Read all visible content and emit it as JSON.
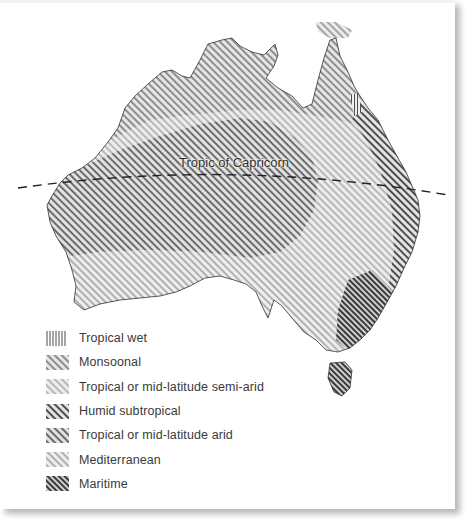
{
  "map": {
    "subject": "Australia climate zones",
    "tropic_line_label": "Tropic of Capricorn"
  },
  "legend": {
    "items": [
      {
        "label": "Tropical wet",
        "pattern": "vertical-lines",
        "color": "#555555"
      },
      {
        "label": "Monsoonal",
        "pattern": "diagonal-medium",
        "color": "#9a9a9a"
      },
      {
        "label": "Tropical or mid-latitude semi-arid",
        "pattern": "diagonal-light",
        "color": "#c4c4c4"
      },
      {
        "label": "Humid subtropical",
        "pattern": "diagonal-dark",
        "color": "#5a5a5a"
      },
      {
        "label": "Tropical or mid-latitude arid",
        "pattern": "diagonal-medium-dark",
        "color": "#7a7a7a"
      },
      {
        "label": "Mediterranean",
        "pattern": "diagonal-light",
        "color": "#bdbdbd"
      },
      {
        "label": "Maritime",
        "pattern": "diagonal-darkest",
        "color": "#3e3e3e"
      }
    ]
  }
}
